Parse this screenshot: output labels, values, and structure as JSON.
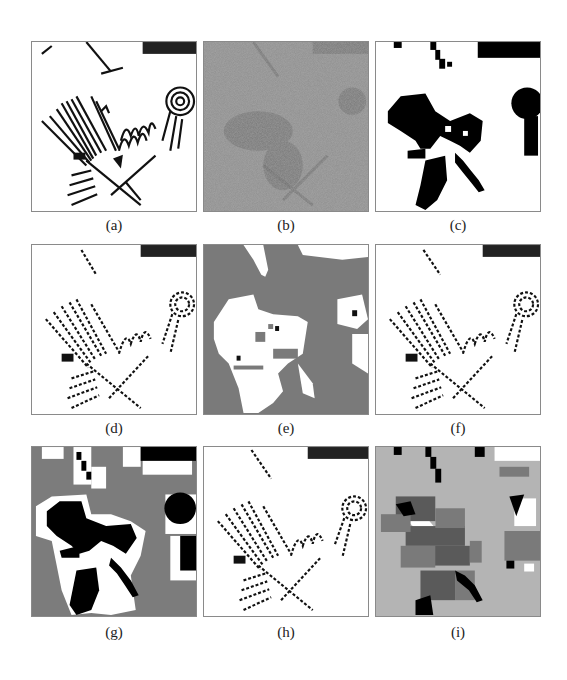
{
  "figure": {
    "panels": [
      {
        "id": "a",
        "label": "(a)",
        "style": "binary-lines",
        "background": "#ffffff"
      },
      {
        "id": "b",
        "label": "(b)",
        "style": "noisy-gray",
        "background": "#8c8c8c"
      },
      {
        "id": "c",
        "label": "(c)",
        "style": "binary-blobs",
        "background": "#ffffff"
      },
      {
        "id": "d",
        "label": "(d)",
        "style": "binary-dotted",
        "background": "#ffffff"
      },
      {
        "id": "e",
        "label": "(e)",
        "style": "gray-white-segmentation",
        "background": "#7a7a7a"
      },
      {
        "id": "f",
        "label": "(f)",
        "style": "binary-dotted",
        "background": "#ffffff"
      },
      {
        "id": "g",
        "label": "(g)",
        "style": "gray-black-white-blocks",
        "background": "#7c7c7c"
      },
      {
        "id": "h",
        "label": "(h)",
        "style": "binary-dotted",
        "background": "#ffffff"
      },
      {
        "id": "i",
        "label": "(i)",
        "style": "multi-gray-blocks",
        "background": "#b4b4b4"
      }
    ]
  }
}
